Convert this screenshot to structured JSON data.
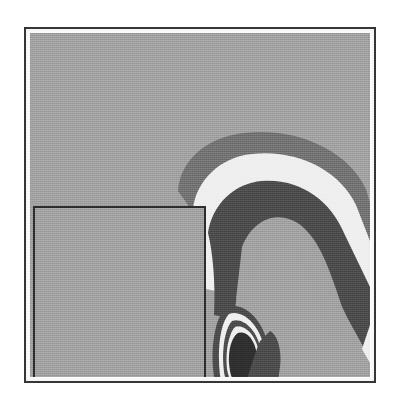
{
  "figure": {
    "kind": "filled-contour-plot",
    "caption": "",
    "frame": {
      "x": 24,
      "y": 27,
      "width": 352,
      "height": 356
    },
    "plot_area": {
      "x": 30,
      "y": 33,
      "width": 340,
      "height": 344
    }
  },
  "palette": {
    "page_background": "#ffffff",
    "frame_stroke": "#3a3a3a",
    "background_level": "#9e9e9e",
    "mid_dark_level": "#6f6f6f",
    "light_level": "#eeeeee",
    "dark_level": "#4a4a4a",
    "darkest_level": "#2e2e2e",
    "inset_box_stroke": "#2b2b2b",
    "inset_box_fill": "#9e9e9e"
  },
  "inset_box": {
    "label": "inset-rectangle",
    "x": 34,
    "y": 207,
    "width": 171,
    "height": 170,
    "stroke_width": 2
  },
  "chart_data": {
    "type": "contour",
    "title": "",
    "subtitle": "",
    "xlabel": "",
    "ylabel": "",
    "grid": false,
    "legend": "none",
    "axis_ticks": "none",
    "xlim": [
      0,
      340
    ],
    "ylim": [
      0,
      344
    ],
    "fill_levels": [
      {
        "id": "level-0",
        "name": "background",
        "color": "#9e9e9e",
        "order": 0
      },
      {
        "id": "level-1",
        "name": "band-mid-dark",
        "color": "#6f6f6f",
        "order": 1
      },
      {
        "id": "level-2",
        "name": "band-light",
        "color": "#eeeeee",
        "order": 2
      },
      {
        "id": "level-3",
        "name": "band-dark",
        "color": "#4a4a4a",
        "order": 3
      },
      {
        "id": "level-4",
        "name": "core-darkest",
        "color": "#2e2e2e",
        "order": 4
      }
    ],
    "features": [
      {
        "id": "outer-arch-mid-dark",
        "level": "level-1",
        "description": "Outer mid-dark band forming a hook/arch sweeping from upper-left over the top and down the right edge.",
        "path": "M 148 158 C 150 128, 176 104, 214 100 C 268 94, 318 118, 336 156 L 340 170 L 340 266 L 330 250 C 312 214, 300 190, 276 176 C 250 160, 220 166, 206 192 C 196 212, 194 232, 192 248 L 170 246 C 168 214, 164 186, 158 172 Z"
      },
      {
        "id": "outer-arch-light",
        "level": "level-2",
        "description": "Light/white band nested inside the outer mid-dark arch.",
        "path": "M 163 176 C 166 148, 190 124, 222 121 C 268 116, 310 138, 326 172 L 340 208 L 340 290 L 326 264 C 306 222, 292 198, 268 186 C 244 174, 218 182, 208 208 C 200 228, 198 244, 196 260 L 176 256 C 176 222, 170 192, 163 176 Z"
      },
      {
        "id": "inner-arch-dark",
        "level": "level-3",
        "description": "Dark inner arch band; inverted-U shape with legs descending, right leg continuing to lower-right corner.",
        "path": "M 178 200 C 182 172, 204 150, 232 148 C 268 145, 300 166, 314 200 L 340 254 L 340 326 L 318 286 C 298 244, 284 216, 262 206 C 240 196, 222 206, 214 230 C 208 250, 206 268, 204 286 L 184 282 C 186 248, 182 216, 178 200 Z"
      },
      {
        "id": "arch-inner-void",
        "level": "level-0",
        "description": "Background-gray void enclosed by the inner dark arch (inside of the inverted U).",
        "path": "M 212 214 C 222 188, 244 178, 264 188 C 284 198, 296 226, 306 256 L 318 292 L 300 300 L 288 262 C 278 232, 268 214, 252 210 C 236 206, 226 218, 222 238 L 218 268 L 206 266 Z"
      },
      {
        "id": "oval-ring-outer-dark",
        "level": "level-3",
        "description": "Outermost dark ring of the concentric teardrop/oval feature in the lower-middle.",
        "path": "M 196 274 C 212 268, 232 284, 238 312 C 244 342, 236 366, 220 374 C 202 382, 188 368, 184 344 C 180 318, 184 286, 196 274 Z"
      },
      {
        "id": "oval-ring-light",
        "level": "level-2",
        "description": "Light ring nested inside the outer dark ring of the oval feature.",
        "path": "M 199 281 C 212 276, 229 291, 234 314 C 239 340, 232 362, 219 368 C 205 374, 194 362, 190 342 C 187 318, 190 290, 199 281 Z"
      },
      {
        "id": "oval-ring-inner-dark",
        "level": "level-3",
        "description": "Second dark ring inside the light ring.",
        "path": "M 202 288 C 213 284, 227 297, 231 317 C 235 339, 229 358, 218 363 C 206 368, 197 357, 194 339 C 191 318, 195 295, 202 288 Z"
      },
      {
        "id": "oval-ring-inner-light",
        "level": "level-2",
        "description": "Innermost light ring.",
        "path": "M 205 294 C 215 291, 226 302, 229 320 C 232 338, 227 354, 217 358 C 207 362, 200 352, 197 336 C 195 318, 199 300, 205 294 Z"
      },
      {
        "id": "oval-core",
        "level": "level-4",
        "description": "Darkest elongated core at the center of the concentric oval feature.",
        "path": "M 208 300 C 217 297, 226 308, 227 324 C 228 340, 223 352, 214 354 C 205 356, 200 345, 199 330 C 198 314, 203 303, 208 300 Z"
      },
      {
        "id": "lower-dark-blob",
        "level": "level-3",
        "description": "Dark wedge/blob protruding downward to the right of the oval, reaching the lower edge of the plot.",
        "path": "M 240 298 C 248 302, 252 318, 250 334 C 248 352, 244 366, 238 377 L 210 377 L 212 362 C 218 344, 224 322, 230 308 Z"
      },
      {
        "id": "lower-light-patch",
        "level": "level-2",
        "description": "Small light patch at the very bottom between the oval tail and the dark blob.",
        "path": "M 188 360 L 212 362 L 210 377 L 186 377 Z"
      },
      {
        "id": "right-edge-light-band",
        "level": "level-2",
        "description": "Light band hugging the right edge below the arch.",
        "path": "M 340 292 L 340 330 L 332 316 Z"
      }
    ]
  }
}
